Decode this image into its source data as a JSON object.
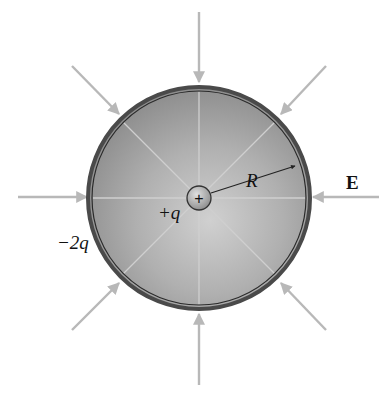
{
  "figure": {
    "labels": {
      "inner_charge": "+q",
      "shell_charge": "−2q",
      "radius": "R",
      "field": "E",
      "plus_sign": "+"
    },
    "colors": {
      "arrow": "#b8b8b8",
      "shell_outer": "#555555",
      "shell_fill": "#a9a9a9",
      "inner_field_lines": "#c8c8c8",
      "text": "#111111"
    },
    "geometry": {
      "center": [
        199,
        198
      ],
      "shell_radius": 112,
      "inner_sphere_radius": 12
    },
    "external_field_arrows": [
      {
        "direction": "inward",
        "from": [
          199,
          12
        ],
        "to": [
          199,
          84
        ]
      },
      {
        "direction": "inward",
        "from": [
          326,
          66
        ],
        "to": [
          280,
          115
        ]
      },
      {
        "direction": "inward",
        "from": [
          379,
          197
        ],
        "to": [
          312,
          197
        ]
      },
      {
        "direction": "inward",
        "from": [
          326,
          330
        ],
        "to": [
          280,
          282
        ]
      },
      {
        "direction": "inward",
        "from": [
          199,
          385
        ],
        "to": [
          199,
          313
        ]
      },
      {
        "direction": "inward",
        "from": [
          72,
          330
        ],
        "to": [
          120,
          282
        ]
      },
      {
        "direction": "inward",
        "from": [
          18,
          197
        ],
        "to": [
          88,
          197
        ]
      },
      {
        "direction": "inward",
        "from": [
          72,
          66
        ],
        "to": [
          120,
          115
        ]
      }
    ]
  }
}
